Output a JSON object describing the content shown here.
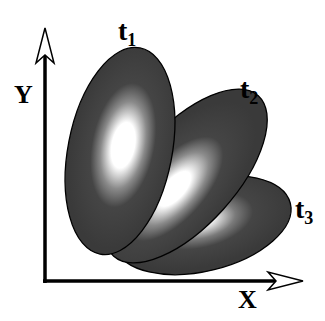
{
  "diagram": {
    "axes": {
      "x_label": "X",
      "y_label": "Y"
    },
    "ellipses": [
      {
        "id": "t1",
        "label": "t",
        "subscript": "1"
      },
      {
        "id": "t2",
        "label": "t",
        "subscript": "2"
      },
      {
        "id": "t3",
        "label": "t",
        "subscript": "3"
      }
    ],
    "colors": {
      "fill": "#3e3e3e",
      "highlight": "#ffffff",
      "stroke": "#000000"
    }
  }
}
